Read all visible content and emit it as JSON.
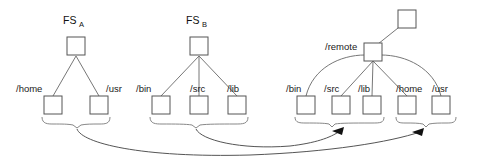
{
  "diagram": {
    "title_a": "FS",
    "title_a_sub": "A",
    "title_b": "FS",
    "title_b_sub": "B",
    "remote_label": "/remote",
    "fs_a": {
      "root_name": "fs-a-root",
      "children": [
        {
          "label": "/home"
        },
        {
          "label": "/usr"
        }
      ]
    },
    "fs_b": {
      "root_name": "fs-b-root",
      "children": [
        {
          "label": "/bin"
        },
        {
          "label": "/src"
        },
        {
          "label": "/lib"
        }
      ]
    },
    "remote_fs": {
      "top_name": "remote-top-node",
      "children": [
        {
          "label": "/bin"
        },
        {
          "label": "/src"
        },
        {
          "label": "/lib"
        },
        {
          "label": "/home"
        },
        {
          "label": "/usr"
        }
      ]
    },
    "colors": {
      "box_stroke": "#555555",
      "edge": "#777777",
      "brace": "#888888",
      "arrow": "#555555",
      "text": "#1a1a1a",
      "background": "#ffffff"
    }
  }
}
